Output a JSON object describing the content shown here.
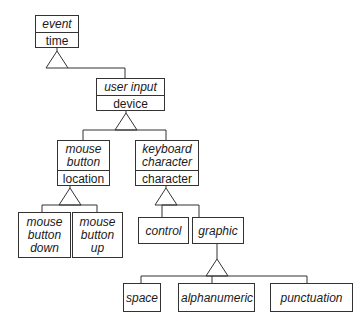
{
  "diagram": {
    "type": "class-hierarchy",
    "nodes": {
      "event": {
        "name": "event",
        "attribute": "time"
      },
      "user_input": {
        "name": "user input",
        "attribute": "device"
      },
      "mouse_button": {
        "name": "mouse\nbutton",
        "attribute": "location"
      },
      "keyboard_character": {
        "name": "keyboard\ncharacter",
        "attribute": "character"
      },
      "mouse_button_down": {
        "name": "mouse\nbutton\ndown"
      },
      "mouse_button_up": {
        "name": "mouse\nbutton\nup"
      },
      "control": {
        "name": "control"
      },
      "graphic": {
        "name": "graphic"
      },
      "space": {
        "name": "space"
      },
      "alphanumeric": {
        "name": "alphanumeric"
      },
      "punctuation": {
        "name": "punctuation"
      }
    },
    "edges": [
      {
        "parent": "event",
        "children": [
          "user_input"
        ]
      },
      {
        "parent": "user_input",
        "children": [
          "mouse_button",
          "keyboard_character"
        ]
      },
      {
        "parent": "mouse_button",
        "children": [
          "mouse_button_down",
          "mouse_button_up"
        ]
      },
      {
        "parent": "keyboard_character",
        "children": [
          "control",
          "graphic"
        ]
      },
      {
        "parent": "graphic",
        "children": [
          "space",
          "alphanumeric",
          "punctuation"
        ]
      }
    ],
    "colors": {
      "line": "#333333",
      "background": "#ffffff"
    }
  }
}
